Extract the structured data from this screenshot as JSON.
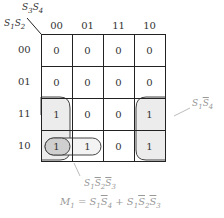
{
  "kmap": {
    "corner": {
      "col_vars": "S3S4",
      "row_vars": "S1S2"
    },
    "col_headers": [
      "00",
      "01",
      "11",
      "10"
    ],
    "row_headers": [
      "00",
      "01",
      "11",
      "10"
    ],
    "cells": [
      [
        "0",
        "0",
        "0",
        "0"
      ],
      [
        "0",
        "0",
        "0",
        "0"
      ],
      [
        "1",
        "0",
        "0",
        "1"
      ],
      [
        "1",
        "1",
        "0",
        "1"
      ]
    ]
  },
  "groups": [
    {
      "term": "S1 S4'",
      "cells": "rows 11-10, cols 00 & 10 (wrap-around)"
    },
    {
      "term": "S1 S2' S3'",
      "cells": "row 10, cols 00-01"
    }
  ],
  "annotations": {
    "group1_label": "S1S4'",
    "group2_label": "S1S2'S3'",
    "equation": "M1 = S1S4' + S1S2'S3'"
  },
  "colors": {
    "group_fill": "#ececec",
    "inner_group_fill": "#cfcfcf",
    "grid": "#222222",
    "annotation": "#999999"
  }
}
